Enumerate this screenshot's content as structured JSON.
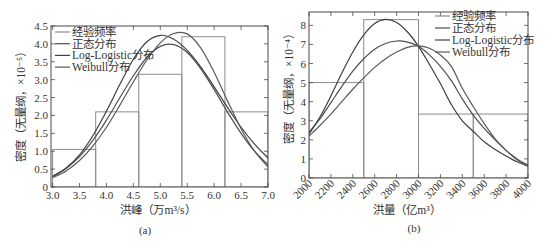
{
  "figure": {
    "colors": {
      "histogram": "#8c8c8c",
      "curves": [
        "#4f4f4f",
        "#3f3f3f",
        "#5a5a5a"
      ],
      "frame": "#4a4a4a",
      "text": "#333333"
    }
  },
  "chart_data": [
    {
      "type": "bar+line",
      "panel": "(a)",
      "xlabel": "洪峰（万m³/s）",
      "ylabel": "密度（无量纲，×10⁻⁵）",
      "xlim": [
        2.97,
        7.0
      ],
      "ylim": [
        0,
        4.5
      ],
      "grid": false,
      "legend_position": "upper left",
      "xticks": [
        3.0,
        3.5,
        4.0,
        4.5,
        5.0,
        5.5,
        6.0,
        6.5,
        7.0
      ],
      "xtick_labels": [
        "3.0",
        "3.5",
        "4.0",
        "4.5",
        "5.0",
        "5.5",
        "6.0",
        "6.5",
        "7.0"
      ],
      "xtick_rotation": 0,
      "yticks": [
        0,
        0.5,
        1.0,
        1.5,
        2.0,
        2.5,
        3.0,
        3.5,
        4.0,
        4.5
      ],
      "ytick_labels": [
        "0",
        "0.5",
        "1.0",
        "1.5",
        "2.0",
        "2.5",
        "3.0",
        "3.5",
        "4.0",
        "4.5"
      ],
      "legend": [
        "经验频率",
        "正态分布",
        "Log-Logistic分布",
        "Weibull分布"
      ],
      "histogram": {
        "name": "经验频率",
        "bin_edges": [
          3.0,
          3.8,
          4.6,
          5.4,
          6.2,
          7.0
        ],
        "values": [
          1.05,
          2.1,
          3.15,
          4.2,
          2.1
        ]
      },
      "x": [
        3.0,
        3.25,
        3.5,
        3.75,
        4.0,
        4.25,
        4.5,
        4.75,
        5.0,
        5.25,
        5.5,
        5.75,
        6.0,
        6.25,
        6.5,
        6.75,
        7.0
      ],
      "series": [
        {
          "name": "正态分布",
          "values": [
            0.29,
            0.52,
            0.85,
            1.31,
            1.87,
            2.5,
            3.11,
            3.62,
            3.93,
            3.98,
            3.76,
            3.31,
            2.72,
            2.09,
            1.5,
            1.0,
            0.62
          ]
        },
        {
          "name": "Log-Logistic分布",
          "values": [
            0.3,
            0.53,
            0.9,
            1.44,
            2.12,
            2.87,
            3.57,
            4.06,
            4.24,
            4.13,
            3.82,
            3.36,
            2.8,
            2.22,
            1.67,
            1.2,
            0.81
          ]
        },
        {
          "name": "Weibull分布",
          "values": [
            0.26,
            0.45,
            0.74,
            1.15,
            1.67,
            2.29,
            2.94,
            3.55,
            4.03,
            4.29,
            4.28,
            3.89,
            3.21,
            2.4,
            1.63,
            1.0,
            0.56
          ]
        }
      ]
    },
    {
      "type": "bar+line",
      "panel": "(b)",
      "xlabel": "洪量（亿m³）",
      "ylabel": "密度（无量纲，×10⁻⁴）",
      "xlim": [
        2000,
        4000
      ],
      "ylim": [
        0,
        8.7
      ],
      "grid": false,
      "legend_position": "upper right",
      "xticks": [
        2000,
        2200,
        2400,
        2600,
        2800,
        3000,
        3200,
        3400,
        3600,
        3800,
        4000
      ],
      "xtick_labels": [
        "2000",
        "2200",
        "2400",
        "2600",
        "2800",
        "3000",
        "3200",
        "3400",
        "3600",
        "3800",
        "4000"
      ],
      "xtick_rotation": -45,
      "yticks": [
        0,
        1,
        2,
        3,
        4,
        5,
        6,
        7,
        8
      ],
      "ytick_labels": [
        "0",
        "1",
        "2",
        "3",
        "4",
        "5",
        "6",
        "7",
        "8"
      ],
      "legend": [
        "经验频率",
        "正态分布",
        "Log-Logistic分布",
        "Weibull分布"
      ],
      "histogram": {
        "name": "经验频率",
        "bin_edges": [
          2000,
          2500,
          3000,
          3500,
          4000
        ],
        "values": [
          5.0,
          8.3,
          3.35,
          3.35
        ]
      },
      "x": [
        2000,
        2100,
        2200,
        2300,
        2400,
        2500,
        2600,
        2700,
        2800,
        2900,
        3000,
        3100,
        3200,
        3300,
        3400,
        3500,
        3600,
        3700,
        3800,
        3900,
        4000
      ],
      "series": [
        {
          "name": "正态分布",
          "values": [
            2.4,
            3.1,
            3.95,
            4.8,
            5.6,
            6.25,
            6.75,
            7.05,
            7.18,
            7.12,
            6.9,
            6.45,
            5.85,
            5.1,
            4.15,
            3.3,
            2.6,
            2.0,
            1.45,
            1.0,
            0.68
          ]
        },
        {
          "name": "Log-Logistic分布",
          "values": [
            2.3,
            3.2,
            4.3,
            5.5,
            6.6,
            7.5,
            8.1,
            8.31,
            8.15,
            7.65,
            6.9,
            5.95,
            4.95,
            3.85,
            3.0,
            2.45,
            1.9,
            1.5,
            1.15,
            0.85,
            0.62
          ]
        },
        {
          "name": "Weibull分布",
          "values": [
            2.2,
            2.75,
            3.35,
            4.0,
            4.65,
            5.25,
            5.8,
            6.25,
            6.6,
            6.85,
            6.92,
            6.8,
            6.45,
            5.85,
            4.7,
            3.75,
            2.85,
            2.05,
            1.45,
            0.95,
            0.62
          ]
        }
      ]
    }
  ]
}
